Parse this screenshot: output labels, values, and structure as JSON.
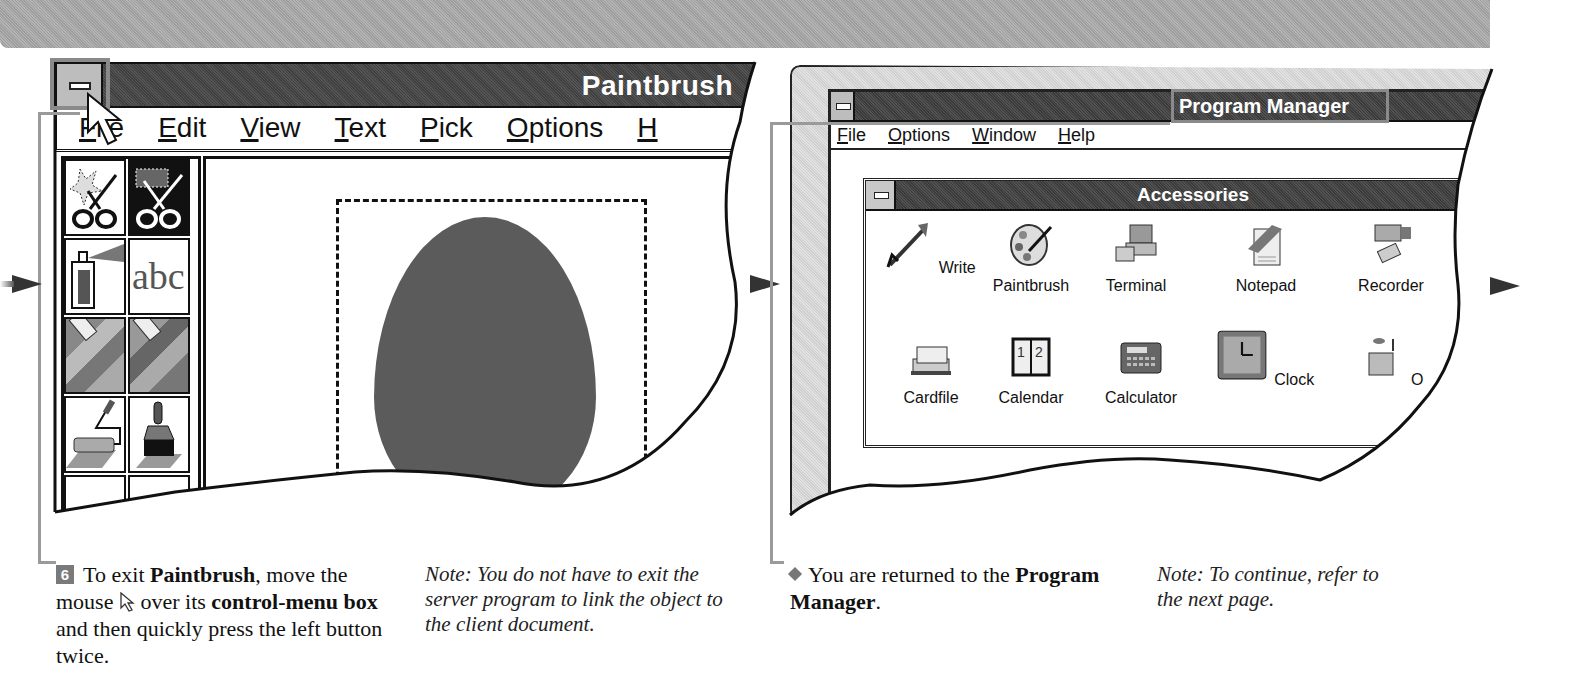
{
  "paintbrush_window": {
    "title": "Paintbrush",
    "menu": [
      {
        "label": "File",
        "mnemonic": "F"
      },
      {
        "label": "Edit",
        "mnemonic": "E"
      },
      {
        "label": "View",
        "mnemonic": "V"
      },
      {
        "label": "Text",
        "mnemonic": "T"
      },
      {
        "label": "Pick",
        "mnemonic": "P"
      },
      {
        "label": "Options",
        "mnemonic": "O"
      },
      {
        "label": "H",
        "mnemonic": "H"
      }
    ],
    "toolbox": [
      {
        "name": "scissors-tool",
        "state": "normal"
      },
      {
        "name": "pick-tool",
        "state": "selected"
      },
      {
        "name": "airbrush-tool",
        "state": "normal"
      },
      {
        "name": "text-tool",
        "label": "abc",
        "state": "normal"
      },
      {
        "name": "color-eraser-tool",
        "state": "normal"
      },
      {
        "name": "eraser-tool",
        "state": "normal"
      },
      {
        "name": "paint-roller-tool",
        "state": "normal"
      },
      {
        "name": "brush-tool",
        "state": "normal"
      }
    ]
  },
  "program_manager": {
    "title": "Program Manager",
    "menu": [
      {
        "label": "File",
        "mnemonic": "F"
      },
      {
        "label": "Options",
        "mnemonic": "O"
      },
      {
        "label": "Window",
        "mnemonic": "W"
      },
      {
        "label": "Help",
        "mnemonic": "H"
      }
    ],
    "group_window": {
      "title": "Accessories",
      "icons": [
        {
          "label": "Write",
          "icon": "write-icon",
          "selected": false
        },
        {
          "label": "Paintbrush",
          "icon": "paintbrush-icon",
          "selected": true
        },
        {
          "label": "Terminal",
          "icon": "terminal-icon",
          "selected": false
        },
        {
          "label": "Notepad",
          "icon": "notepad-icon",
          "selected": false
        },
        {
          "label": "Recorder",
          "icon": "recorder-icon",
          "selected": false
        },
        {
          "label": "Cardfile",
          "icon": "cardfile-icon",
          "selected": false
        },
        {
          "label": "Calendar",
          "icon": "calendar-icon",
          "selected": false
        },
        {
          "label": "Calculator",
          "icon": "calculator-icon",
          "selected": false
        },
        {
          "label": "Clock",
          "icon": "clock-icon",
          "selected": false
        },
        {
          "label": "O",
          "icon": "object-packager-icon",
          "selected": false
        }
      ]
    }
  },
  "captions": {
    "step": {
      "number": "6",
      "text_1": " To exit ",
      "bold_1": "Paintbrush",
      "text_2": ", move the mouse ",
      "text_3": " over its ",
      "bold_2": "control-menu box",
      "text_4": " and then quickly press the left button twice."
    },
    "note_left": "Note: You do not have to exit the server program to link the object to the client document.",
    "result": {
      "text_1": "You are returned to the ",
      "bold_1": "Program Manager",
      "text_2": "."
    },
    "note_right": "Note: To continue, refer to the next page."
  },
  "colors": {
    "titlebar": "#444444",
    "banner": "#a8a8a8",
    "highlight_box": "#8a8a8a",
    "selected_label_bg": "#555555"
  }
}
